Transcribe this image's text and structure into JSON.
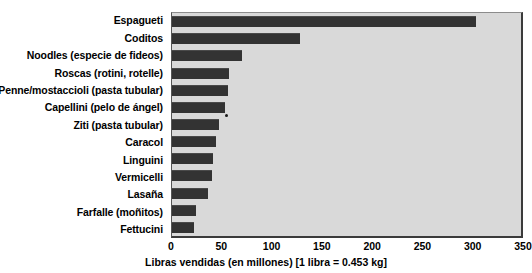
{
  "chart_data": {
    "type": "bar",
    "orientation": "horizontal",
    "title": "",
    "xlabel": "Libras vendidas (en millones) [1 libra = 0.453 kg]",
    "ylabel": "",
    "xlim": [
      0,
      350
    ],
    "xticks": [
      0,
      50,
      100,
      150,
      200,
      250,
      300,
      350
    ],
    "xtick_labels": [
      "0",
      "50",
      "100",
      "150",
      "200",
      "250",
      "300",
      "350"
    ],
    "grid": false,
    "legend": null,
    "bar_color": "#333333",
    "plot_background": "#d9d9d9",
    "categories": [
      "Espagueti",
      "Coditos",
      "Noodles (especie de fideos)",
      "Roscas (rotini, rotelle)",
      "Penne/mostaccioli (pasta tubular)",
      "Capellini (pelo de ángel)",
      "Ziti (pasta tubular)",
      "Caracol",
      "Linguini",
      "Vermicelli",
      "Lasaña",
      "Farfalle (moñitos)",
      "Fettucini"
    ],
    "values": [
      305,
      128,
      70,
      57,
      56,
      53,
      47,
      44,
      41,
      40,
      36,
      24,
      22
    ]
  }
}
